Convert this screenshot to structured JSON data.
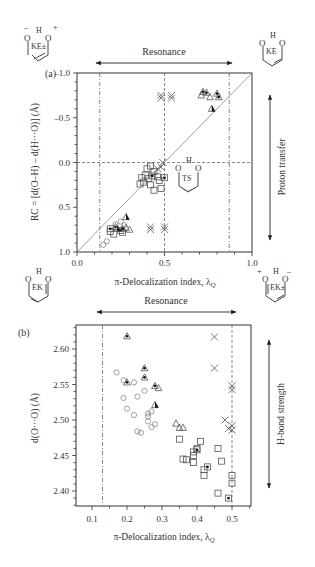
{
  "chart_data": [
    {
      "panel": "(a)",
      "type": "scatter",
      "xlabel": "π-Delocalization index, λ_Q",
      "ylabel": "RC = [d(O–H) – d(H···O)] (Å)",
      "xlim": [
        0.0,
        1.0
      ],
      "ylim": [
        1.0,
        -1.0
      ],
      "y_inverted": true,
      "xticks": [
        "0.0",
        "0.5",
        "1.0"
      ],
      "yticks": [
        "-1.0",
        "-0.5",
        "0.0",
        "0.5",
        "1.0"
      ],
      "reference_lines": {
        "diagonal": "from (0.0, 1.0) to (1.0, -1.0)",
        "dash_dot_vertical": [
          0.13,
          0.87
        ],
        "dashed_vertical": 0.5,
        "dashed_horizontal": 0.0
      },
      "annotations": {
        "top_arrow": "Resonance",
        "right_arrow": "Proton transfer",
        "structures": [
          "KE±",
          "KE",
          "TS",
          "EK",
          "EK±"
        ]
      },
      "series": [
        {
          "name": "circles",
          "marker": "open-circle",
          "points": [
            [
              0.15,
              0.92
            ],
            [
              0.17,
              0.88
            ],
            [
              0.22,
              0.69
            ],
            [
              0.25,
              0.66
            ],
            [
              0.27,
              0.7
            ]
          ]
        },
        {
          "name": "squares",
          "marker": "open-square",
          "points": [
            [
              0.37,
              0.17
            ],
            [
              0.39,
              0.14
            ],
            [
              0.4,
              0.07
            ],
            [
              0.42,
              0.04
            ],
            [
              0.44,
              0.1
            ],
            [
              0.41,
              0.18
            ],
            [
              0.46,
              0.16
            ],
            [
              0.38,
              0.22
            ],
            [
              0.42,
              0.25
            ],
            [
              0.47,
              0.2
            ],
            [
              0.44,
              0.31
            ],
            [
              0.48,
              0.29
            ],
            [
              0.36,
              0.24
            ],
            [
              0.19,
              0.77
            ],
            [
              0.21,
              0.8
            ],
            [
              0.26,
              0.78
            ]
          ]
        },
        {
          "name": "dotted-squares",
          "marker": "square-with-dot",
          "points": [
            [
              0.43,
              0.15
            ],
            [
              0.5,
              0.17
            ],
            [
              0.19,
              0.74
            ],
            [
              0.25,
              0.76
            ]
          ]
        },
        {
          "name": "triangles",
          "marker": "open-triangle",
          "points": [
            [
              0.28,
              0.73
            ],
            [
              0.3,
              0.75
            ],
            [
              0.71,
              -0.75
            ],
            [
              0.76,
              -0.73
            ]
          ]
        },
        {
          "name": "dotted-triangles",
          "marker": "triangle-with-dot",
          "points": [
            [
              0.72,
              -0.79
            ],
            [
              0.74,
              -0.78
            ],
            [
              0.8,
              -0.77
            ],
            [
              0.81,
              -0.73
            ],
            [
              0.26,
              0.74
            ],
            [
              0.22,
              0.72
            ]
          ]
        },
        {
          "name": "filled-triangles",
          "marker": "half-filled-triangle",
          "points": [
            [
              0.77,
              -0.6
            ],
            [
              0.28,
              0.61
            ],
            [
              0.23,
              0.74
            ]
          ]
        },
        {
          "name": "crosses",
          "marker": "x-cross",
          "points": [
            [
              0.42,
              0.75
            ],
            [
              0.5,
              0.75
            ],
            [
              0.5,
              0.72
            ],
            [
              0.42,
              0.72
            ],
            [
              0.48,
              -0.75
            ],
            [
              0.54,
              -0.75
            ],
            [
              0.48,
              -0.72
            ],
            [
              0.54,
              -0.72
            ],
            [
              0.46,
              0.07
            ],
            [
              0.48,
              0.05
            ],
            [
              0.49,
              0.0
            ]
          ]
        }
      ]
    },
    {
      "panel": "(b)",
      "type": "scatter",
      "xlabel": "π-Delocalization index, λ_Q",
      "ylabel": "d(O···O) (Å)",
      "xlim": [
        0.05,
        0.55
      ],
      "ylim": [
        2.38,
        2.63
      ],
      "xticks": [
        "0.1",
        "0.2",
        "0.3",
        "0.4",
        "0.5"
      ],
      "yticks": [
        "2.40",
        "2.45",
        "2.50",
        "2.55",
        "2.60"
      ],
      "reference_lines": {
        "dash_dot_vertical": 0.13,
        "dashed_vertical": 0.5
      },
      "annotations": {
        "top_arrow": "Resonance",
        "right_arrow": "H-bond strength"
      },
      "series": [
        {
          "name": "circles",
          "marker": "open-circle",
          "points": [
            [
              0.17,
              2.567
            ],
            [
              0.19,
              2.556
            ],
            [
              0.22,
              2.553
            ],
            [
              0.19,
              2.531
            ],
            [
              0.23,
              2.533
            ],
            [
              0.25,
              2.541
            ],
            [
              0.2,
              2.516
            ],
            [
              0.22,
              2.507
            ],
            [
              0.26,
              2.509
            ],
            [
              0.27,
              2.512
            ],
            [
              0.26,
              2.498
            ],
            [
              0.28,
              2.494
            ],
            [
              0.27,
              2.49
            ],
            [
              0.23,
              2.484
            ],
            [
              0.24,
              2.482
            ],
            [
              0.26,
              2.505
            ]
          ]
        },
        {
          "name": "triangles",
          "marker": "open-triangle",
          "points": [
            [
              0.29,
              2.545
            ],
            [
              0.34,
              2.495
            ],
            [
              0.35,
              2.489
            ],
            [
              0.36,
              2.489
            ]
          ]
        },
        {
          "name": "dotted-triangles",
          "marker": "triangle-with-dot",
          "points": [
            [
              0.2,
              2.618
            ],
            [
              0.25,
              2.573
            ],
            [
              0.25,
              2.56
            ],
            [
              0.2,
              2.553
            ],
            [
              0.28,
              2.548
            ]
          ]
        },
        {
          "name": "filled-triangles",
          "marker": "half-filled-triangle",
          "points": [
            [
              0.28,
              2.521
            ]
          ]
        },
        {
          "name": "squares",
          "marker": "open-square",
          "points": [
            [
              0.35,
              2.473
            ],
            [
              0.36,
              2.445
            ],
            [
              0.37,
              2.444
            ],
            [
              0.39,
              2.45
            ],
            [
              0.39,
              2.455
            ],
            [
              0.39,
              2.44
            ],
            [
              0.4,
              2.46
            ],
            [
              0.41,
              2.47
            ],
            [
              0.42,
              2.43
            ],
            [
              0.42,
              2.422
            ],
            [
              0.46,
              2.46
            ],
            [
              0.47,
              2.442
            ],
            [
              0.5,
              2.422
            ],
            [
              0.5,
              2.411
            ],
            [
              0.46,
              2.397
            ]
          ]
        },
        {
          "name": "dotted-squares",
          "marker": "square-with-dot",
          "points": [
            [
              0.4,
              2.458
            ],
            [
              0.43,
              2.434
            ],
            [
              0.49,
              2.39
            ]
          ]
        },
        {
          "name": "crosses",
          "marker": "x-cross",
          "points": [
            [
              0.45,
              2.617
            ],
            [
              0.45,
              2.573
            ],
            [
              0.5,
              2.548
            ],
            [
              0.5,
              2.543
            ],
            [
              0.48,
              2.5
            ],
            [
              0.5,
              2.492
            ],
            [
              0.49,
              2.488
            ],
            [
              0.5,
              2.486
            ]
          ]
        }
      ]
    }
  ],
  "figure": {
    "panel_a_label": "(a)",
    "panel_b_label": "(b)",
    "resonance_label": "Resonance",
    "proton_transfer_label": "Proton transfer",
    "hbond_label": "H-bond strength",
    "xlabel_main": "π-Delocalization index, λ",
    "xlabel_sub": "Q",
    "ylabel_a": "RC = [d(O–H) – d(H···O)] (Å)",
    "ylabel_b": "d(O···O) (Å)",
    "structures": {
      "ke_pm": "KE±",
      "ke": "KE",
      "ts": "TS",
      "ek": "EK",
      "ek_pm": "EK±"
    }
  }
}
